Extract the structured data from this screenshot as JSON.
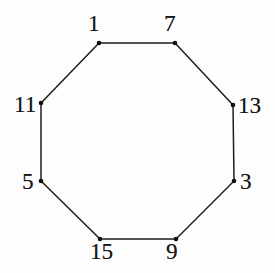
{
  "figure": {
    "type": "geometric-diagram",
    "shape": "regular-octagon",
    "background_color": "#fdfdfd",
    "stroke_color": "#1d1d1d",
    "label_color": "#161616",
    "vertex_dot_color": "#101010",
    "stroke_width": 1.5,
    "vertex_dot_radius": 2.3,
    "width": 275,
    "height": 273
  },
  "vertices": [
    {
      "label": "1",
      "x": 99,
      "y": 43,
      "label_x": 88,
      "label_y": 12,
      "position": "top-left"
    },
    {
      "label": "7",
      "x": 175,
      "y": 43,
      "label_x": 164,
      "label_y": 12,
      "position": "top-right"
    },
    {
      "label": "13",
      "x": 233,
      "y": 105,
      "label_x": 238,
      "label_y": 94,
      "position": "right-upper"
    },
    {
      "label": "3",
      "x": 234,
      "y": 181,
      "label_x": 240,
      "label_y": 170,
      "position": "right-lower"
    },
    {
      "label": "9",
      "x": 176,
      "y": 239,
      "label_x": 166,
      "label_y": 240,
      "position": "bottom-right"
    },
    {
      "label": "15",
      "x": 100,
      "y": 239,
      "label_x": 90,
      "label_y": 240,
      "position": "bottom-left"
    },
    {
      "label": "5",
      "x": 41,
      "y": 181,
      "label_x": 22,
      "label_y": 170,
      "position": "left-lower"
    },
    {
      "label": "11",
      "x": 41,
      "y": 103,
      "label_x": 14,
      "label_y": 93,
      "position": "left-upper"
    }
  ],
  "edges": [
    {
      "from": "1",
      "to": "7"
    },
    {
      "from": "7",
      "to": "13"
    },
    {
      "from": "13",
      "to": "3"
    },
    {
      "from": "3",
      "to": "9"
    },
    {
      "from": "9",
      "to": "15"
    },
    {
      "from": "15",
      "to": "5"
    },
    {
      "from": "5",
      "to": "11"
    },
    {
      "from": "11",
      "to": "1"
    }
  ]
}
